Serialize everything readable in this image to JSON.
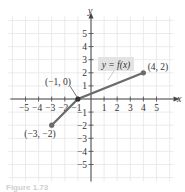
{
  "chart_data": {
    "type": "line",
    "title": "",
    "xlabel": "x",
    "ylabel": "y",
    "xlim": [
      -6.3,
      6.3
    ],
    "ylim": [
      -6.3,
      6.3
    ],
    "grid": true,
    "x_ticks": [
      -5,
      -4,
      -3,
      -2,
      -1,
      1,
      2,
      3,
      4,
      5
    ],
    "y_ticks": [
      -5,
      -4,
      -3,
      -2,
      -1,
      1,
      2,
      3,
      4,
      5
    ],
    "series": [
      {
        "name": "y = f(x)",
        "x": [
          -3,
          -1,
          4
        ],
        "y": [
          -2,
          0,
          2
        ],
        "color": "#6b6b6b",
        "endpoints": true
      }
    ],
    "annotations": [
      {
        "text": "(-3, -2)",
        "x": -3,
        "y": -2
      },
      {
        "text": "(-1, 0)",
        "x": -1,
        "y": 0
      },
      {
        "text": "(4, 2)",
        "x": 4,
        "y": 2
      },
      {
        "text": "y = f(x)",
        "boxed": true
      }
    ]
  },
  "labels": {
    "x_axis": "x",
    "y_axis": "y",
    "function_label": "y = f(x)",
    "point_a": "(−3, −2)",
    "point_b": "(−1, 0)",
    "point_c": "(4, 2)",
    "caption": "Figure 1.73"
  },
  "colors": {
    "grid": "#e6e6e6",
    "axis": "#444444",
    "curve": "#6b6b6b",
    "label_box": "#e3e3e3"
  }
}
